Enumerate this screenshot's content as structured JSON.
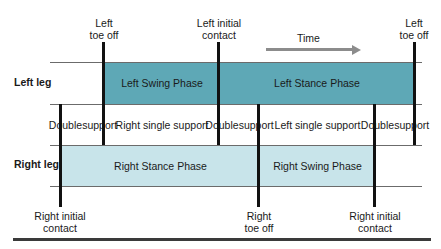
{
  "diagram": {
    "time_label": "Time",
    "rows": {
      "left_leg": {
        "label": "Left leg"
      },
      "right_leg": {
        "label": "Right leg"
      }
    },
    "phases": {
      "left_swing": "Left Swing Phase",
      "left_stance": "Left Stance Phase",
      "right_stance": "Right Stance Phase",
      "right_swing": "Right Swing Phase"
    },
    "support": {
      "double_1": "Double support",
      "right_single": "Right single support",
      "double_2": "Double support",
      "left_single": "Left single support",
      "double_3": "Double support"
    },
    "events_top": [
      {
        "line1": "Left",
        "line2": "toe off"
      },
      {
        "line1": "Left initial",
        "line2": "contact"
      },
      {
        "line1": "Left",
        "line2": "toe off"
      }
    ],
    "events_bottom": [
      {
        "line1": "Right initial",
        "line2": "contact"
      },
      {
        "line1": "Right",
        "line2": "toe off"
      },
      {
        "line1": "Right initial",
        "line2": "contact"
      }
    ],
    "colors": {
      "left_band": "#5ea8b6",
      "right_band": "#c8e4ea",
      "event_line": "#111111",
      "arrow": "#8c8c8c"
    }
  }
}
